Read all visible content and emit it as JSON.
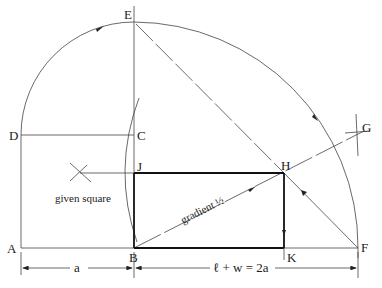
{
  "diagram": {
    "points": {
      "A": {
        "label": "A",
        "x": 21,
        "y": 248
      },
      "B": {
        "label": "B",
        "x": 134,
        "y": 248
      },
      "C": {
        "label": "C",
        "x": 134,
        "y": 135
      },
      "D": {
        "label": "D",
        "x": 21,
        "y": 135
      },
      "E": {
        "label": "E",
        "x": 134,
        "y": 22
      },
      "F": {
        "label": "F",
        "x": 358,
        "y": 248
      },
      "G": {
        "label": "G",
        "x": 358,
        "y": 134
      },
      "H": {
        "label": "H",
        "x": 284,
        "y": 173
      },
      "J": {
        "label": "J",
        "x": 134,
        "y": 173
      },
      "K": {
        "label": "K",
        "x": 284,
        "y": 248
      }
    },
    "annotations": {
      "given_square": "given square",
      "gradient": "gradient ½",
      "dim_a": "a",
      "dim_sum": "ℓ + w = 2a"
    }
  }
}
